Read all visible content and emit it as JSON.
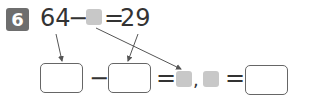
{
  "problem": {
    "number": "6",
    "equation": {
      "left": "64",
      "minus": "−",
      "equals": "=",
      "right": "29"
    },
    "answer_row": {
      "minus": "−",
      "equals1": "=",
      "comma": ",",
      "equals2": "="
    },
    "colors": {
      "badge": "#6e6e6e",
      "placeholder": "#c8c8c8",
      "arrow": "#555555"
    }
  }
}
